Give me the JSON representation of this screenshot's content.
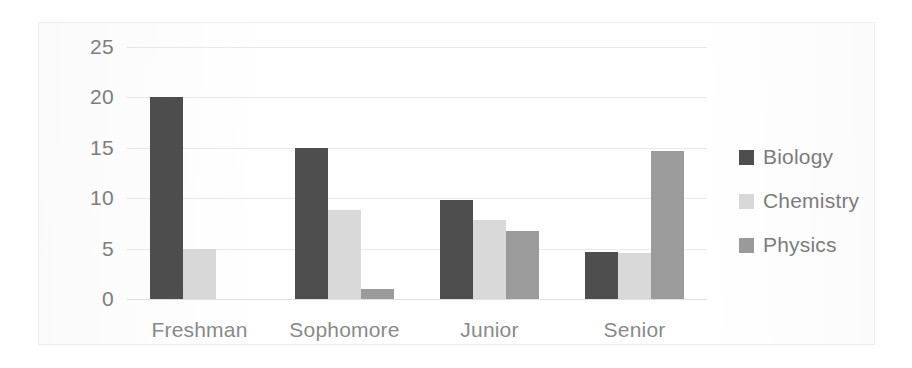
{
  "chart_data": {
    "type": "bar",
    "title": "",
    "xlabel": "",
    "ylabel": "",
    "categories": [
      "Freshman",
      "Sophomore",
      "Junior",
      "Senior"
    ],
    "series": [
      {
        "name": "Biology",
        "color": "#4e4e4e",
        "values": [
          20,
          15,
          9.8,
          4.7
        ]
      },
      {
        "name": "Chemistry",
        "color": "#d9d9d9",
        "values": [
          5,
          8.8,
          7.8,
          4.6
        ]
      },
      {
        "name": "Physics",
        "color": "#9b9b9b",
        "values": [
          0,
          1,
          6.7,
          14.7
        ]
      }
    ],
    "ylim": [
      0,
      25
    ],
    "yticks": [
      "0",
      "5",
      "10",
      "15",
      "20",
      "25"
    ],
    "ytick_values": [
      0,
      5,
      10,
      15,
      20,
      25
    ],
    "grid": true,
    "legend_position": "right"
  }
}
